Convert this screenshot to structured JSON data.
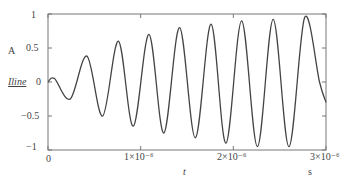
{
  "chart_data": {
    "type": "line",
    "title": "",
    "xlabel": "t",
    "xunit": "s",
    "ylabel": "Iline",
    "yunit": "A",
    "xlim": [
      0,
      3e-06
    ],
    "ylim": [
      -1,
      1
    ],
    "x_ticks": [
      "0",
      "1×10⁻⁶",
      "2×10⁻⁶",
      "3×10⁻⁶"
    ],
    "y_ticks": [
      "1",
      "0.5",
      "0",
      "−0.5",
      "−1"
    ],
    "grid": false,
    "series": [
      {
        "name": "Iline",
        "description": "Growing oscillation, period ≈ 0.4×10⁻⁶ s",
        "x": [
          0,
          7e-08,
          2.4e-07,
          4.2e-07,
          5.9e-07,
          7.6e-07,
          9.2e-07,
          1.09e-06,
          1.25e-06,
          1.42e-06,
          1.59e-06,
          1.76e-06,
          1.92e-06,
          2.09e-06,
          2.26e-06,
          2.43e-06,
          2.6e-06,
          2.77e-06,
          2.93e-06,
          3e-06
        ],
        "values": [
          0,
          0.05,
          -0.25,
          0.38,
          -0.5,
          0.6,
          -0.65,
          0.7,
          -0.75,
          0.8,
          -0.82,
          0.85,
          -0.9,
          0.9,
          -0.95,
          0.92,
          -0.95,
          0.95,
          0.0,
          -0.3
        ]
      }
    ]
  },
  "labels": {
    "y_unit": "A",
    "y_name": "Iline",
    "x_name": "t",
    "x_unit": "s",
    "y_ticks": [
      "1",
      "0.5",
      "0",
      "−0.5",
      "−1"
    ],
    "x_ticks": [
      "0",
      "1×10⁻⁶",
      "2×10⁻⁶",
      "3×10⁻⁶"
    ]
  }
}
